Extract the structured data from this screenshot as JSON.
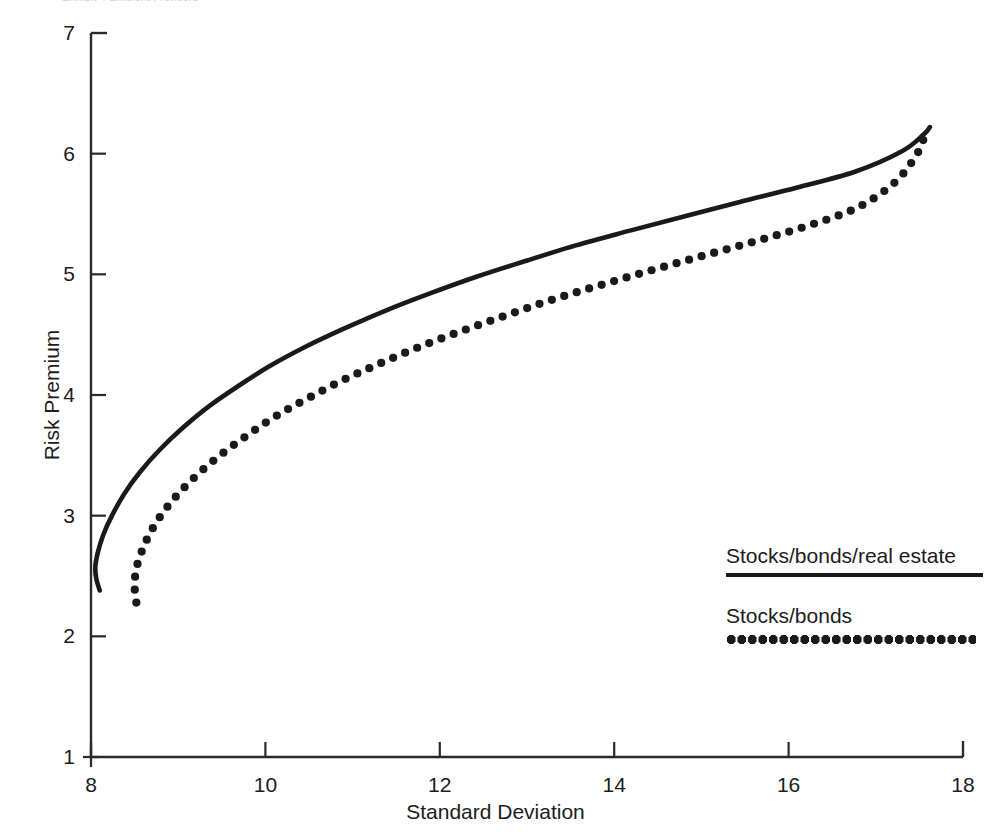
{
  "header": {
    "cutoff_text": "Exhibit 4  Efficient Frontiers"
  },
  "chart_data": {
    "type": "line",
    "title": "",
    "subtitle": "",
    "xlabel": "Standard Deviation",
    "ylabel": "Risk Premium",
    "xlim": [
      8,
      18
    ],
    "ylim": [
      1,
      7
    ],
    "xticks": [
      8,
      10,
      12,
      14,
      16,
      18
    ],
    "yticks": [
      1,
      2,
      3,
      4,
      5,
      6,
      7
    ],
    "xtick_labels": [
      "8",
      "10",
      "12",
      "14",
      "16",
      "18"
    ],
    "ytick_labels": [
      "1",
      "2",
      "3",
      "4",
      "5",
      "6",
      "7"
    ],
    "grid": false,
    "legend_position": "bottom-right",
    "series": [
      {
        "name": "Stocks/bonds/real estate",
        "style": "solid",
        "color": "#1a1a1a",
        "points": [
          [
            8.1,
            2.38
          ],
          [
            8.06,
            2.48
          ],
          [
            8.05,
            2.58
          ],
          [
            8.08,
            2.7
          ],
          [
            8.14,
            2.84
          ],
          [
            8.24,
            3.0
          ],
          [
            8.38,
            3.18
          ],
          [
            8.56,
            3.36
          ],
          [
            8.78,
            3.54
          ],
          [
            9.04,
            3.72
          ],
          [
            9.34,
            3.9
          ],
          [
            9.68,
            4.07
          ],
          [
            10.05,
            4.24
          ],
          [
            10.46,
            4.4
          ],
          [
            10.9,
            4.55
          ],
          [
            11.38,
            4.7
          ],
          [
            11.88,
            4.84
          ],
          [
            12.42,
            4.98
          ],
          [
            12.98,
            5.11
          ],
          [
            13.56,
            5.24
          ],
          [
            14.17,
            5.36
          ],
          [
            14.8,
            5.48
          ],
          [
            15.44,
            5.6
          ],
          [
            16.1,
            5.72
          ],
          [
            16.76,
            5.85
          ],
          [
            17.3,
            6.02
          ],
          [
            17.55,
            6.16
          ],
          [
            17.62,
            6.22
          ]
        ]
      },
      {
        "name": "Stocks/bonds",
        "style": "dotted",
        "color": "#1a1a1a",
        "points": [
          [
            8.52,
            2.28
          ],
          [
            8.5,
            2.42
          ],
          [
            8.52,
            2.56
          ],
          [
            8.58,
            2.7
          ],
          [
            8.68,
            2.86
          ],
          [
            8.82,
            3.02
          ],
          [
            9.0,
            3.18
          ],
          [
            9.22,
            3.34
          ],
          [
            9.48,
            3.5
          ],
          [
            9.78,
            3.66
          ],
          [
            10.11,
            3.82
          ],
          [
            10.48,
            3.97
          ],
          [
            10.88,
            4.12
          ],
          [
            11.31,
            4.26
          ],
          [
            11.77,
            4.4
          ],
          [
            12.25,
            4.53
          ],
          [
            12.76,
            4.66
          ],
          [
            13.29,
            4.79
          ],
          [
            13.84,
            4.91
          ],
          [
            14.41,
            5.03
          ],
          [
            15.0,
            5.15
          ],
          [
            15.6,
            5.27
          ],
          [
            16.21,
            5.4
          ],
          [
            16.78,
            5.55
          ],
          [
            17.2,
            5.75
          ],
          [
            17.45,
            5.97
          ],
          [
            17.56,
            6.14
          ],
          [
            17.6,
            6.21
          ]
        ]
      }
    ]
  },
  "legend": {
    "entries": [
      {
        "label": "Stocks/bonds/real estate",
        "style": "solid"
      },
      {
        "label": "Stocks/bonds",
        "style": "dotted"
      }
    ]
  }
}
